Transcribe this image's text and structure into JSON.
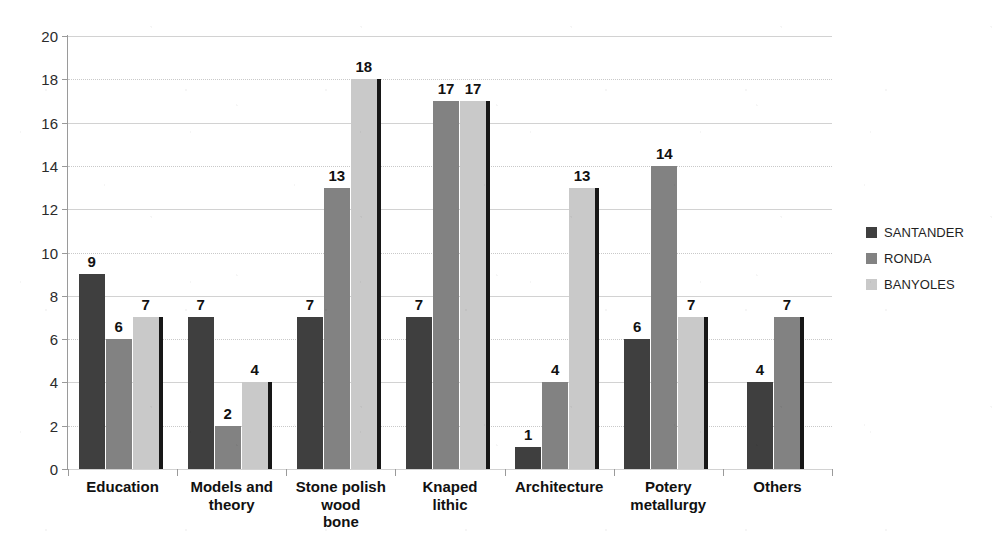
{
  "chart_data": {
    "type": "bar",
    "title": "",
    "subtitle": "",
    "xlabel": "",
    "ylabel": "",
    "ylim": [
      0,
      20
    ],
    "ytick_step": 2,
    "yticks": [
      "0",
      "2",
      "4",
      "6",
      "8",
      "10",
      "12",
      "14",
      "16",
      "18",
      "20"
    ],
    "grid": true,
    "grid_axis": "y",
    "legend_position": "right",
    "data_labels": true,
    "categories": [
      "Education",
      "Models and theory",
      "Stone polish wood bone",
      "Knaped lithic",
      "Architecture",
      "Potery metallurgy",
      "Others"
    ],
    "category_lines": [
      [
        "Education"
      ],
      [
        "Models and",
        "theory"
      ],
      [
        "Stone polish",
        "wood",
        "bone"
      ],
      [
        "Knaped",
        "lithic"
      ],
      [
        "Architecture"
      ],
      [
        "Potery",
        "metallurgy"
      ],
      [
        "Others"
      ]
    ],
    "series": [
      {
        "name": "SANTANDER",
        "color": "#3f3f3f",
        "values": [
          9,
          7,
          7,
          7,
          1,
          6,
          4
        ],
        "labels": [
          "9",
          "7",
          "7",
          "7",
          "1",
          "6",
          "4"
        ]
      },
      {
        "name": "RONDA",
        "color": "#828282",
        "values": [
          6,
          2,
          13,
          17,
          4,
          14,
          7
        ],
        "labels": [
          "6",
          "2",
          "13",
          "17",
          "4",
          "14",
          "7"
        ]
      },
      {
        "name": "BANYOLES",
        "color": "#c9c9c9",
        "values": [
          7,
          4,
          18,
          17,
          13,
          7,
          null
        ],
        "labels": [
          "7",
          "4",
          "18",
          "17",
          "13",
          "7",
          ""
        ]
      }
    ]
  },
  "legend": {
    "items": [
      {
        "label": "SANTANDER",
        "color": "#3f3f3f"
      },
      {
        "label": "RONDA",
        "color": "#828282"
      },
      {
        "label": "BANYOLES",
        "color": "#c9c9c9"
      }
    ]
  },
  "colors": {
    "santander": "#3f3f3f",
    "ronda": "#828282",
    "banyoles": "#c9c9c9",
    "bar_edge": "#171717",
    "axis": "#9a9a9a",
    "gridline": "#d2d2d2",
    "text": "#111111",
    "background": "#ffffff"
  }
}
